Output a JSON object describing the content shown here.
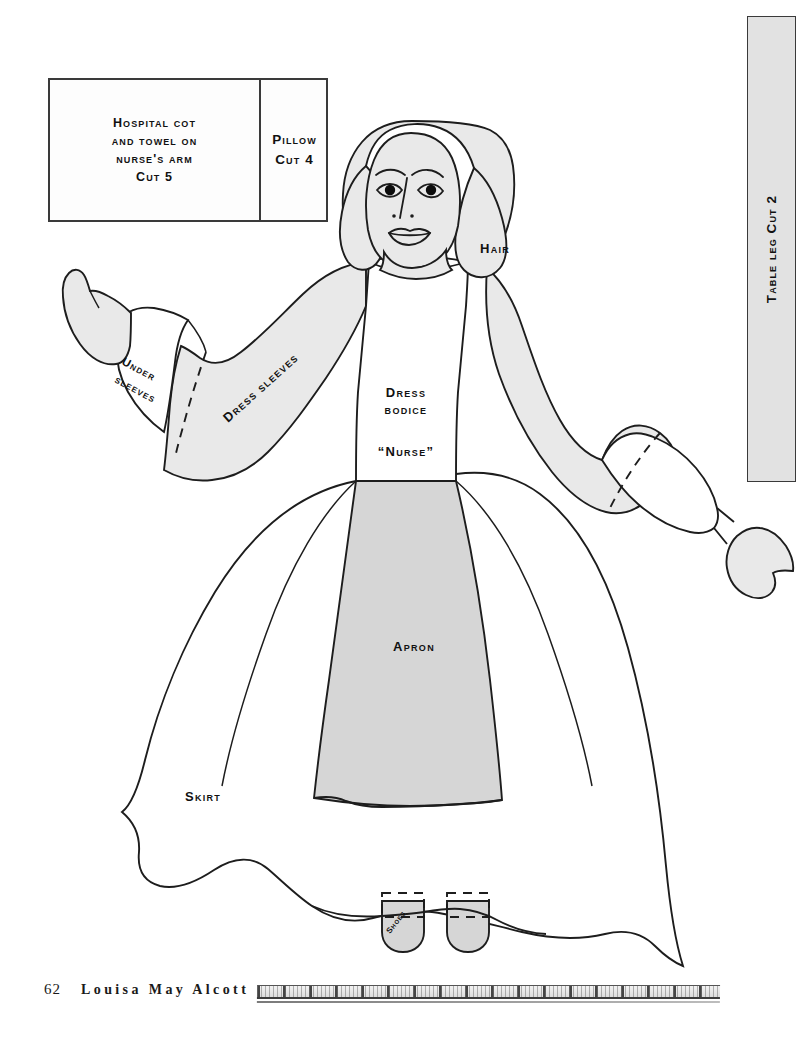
{
  "page": {
    "folio": "62",
    "running_head": "Louisa May Alcott",
    "background_color": "#ffffff",
    "ink_color": "#1d1d1d"
  },
  "cot_box": {
    "left_panel_label": "Hospital cot and towel on nurse's arm Cut 5",
    "left_panel_lines": [
      "Hospital cot",
      "and towel on",
      "nurse's arm",
      "Cut 5"
    ],
    "right_panel_lines": [
      "Pillow",
      "Cut 4"
    ],
    "right_panel_label": "Pillow Cut 4"
  },
  "table_leg": {
    "label": "Table leg Cut 2",
    "fill": "#e2e2e2"
  },
  "figure": {
    "labels": {
      "hair": "Hair",
      "under_sleeves_line1": "Under",
      "under_sleeves_line2": "sleeves",
      "dress_sleeves": "Dress sleeves",
      "dress_bodice_line1": "Dress",
      "dress_bodice_line2": "bodice",
      "nurse": "“Nurse”",
      "apron": "Apron",
      "skirt": "Skirt",
      "shoes": "Shoes"
    },
    "colors": {
      "hair_fill": "#e9e9e9",
      "sleeve_fill": "#e9e9e9",
      "apron_fill": "#d6d6d6",
      "shoe_fill": "#d6d6d6",
      "bodice_fill": "#ffffff",
      "skirt_fill": "#ffffff"
    }
  }
}
